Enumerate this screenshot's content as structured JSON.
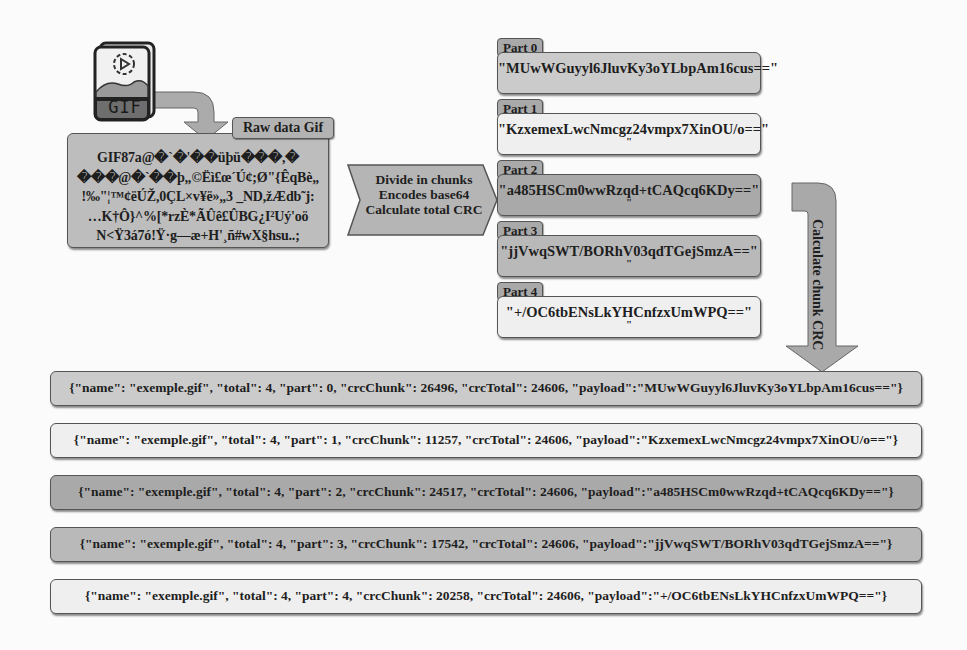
{
  "colors": {
    "light_box": "#efefef",
    "mid_box": "#c6c6c6",
    "dark_box": "#a8a8a8",
    "arrow_fill": "#ababab",
    "border": "#555555"
  },
  "gif_icon": {
    "label": "GIF",
    "icon": "gif-file-icon"
  },
  "raw_data": {
    "tag": "Raw data Gif",
    "lines": [
      "GIF87a@�`�'��üþü���,�",
      "���@�`��þ„©Ëì£œ´Ú¢;Ø\"{ÊqBè„",
      "!‰\"¦™¢ëÚŽ,0ÇL×v¥ë»„3  _ND,žÆdb˜j:",
      "…K†Ô}^%[*rzÈ*ÃÛê£ÛBG¿I²Uý'oö",
      "N<Ÿ3á7ó!Ÿ·g—æ+H'¸ñ#wX§hsu..;"
    ]
  },
  "process_arrow": {
    "lines": [
      "Divide in chunks",
      "Encodes base64",
      "Calculate total CRC"
    ]
  },
  "parts": [
    {
      "tag": "Part 0",
      "value": "\"MUwWGuyyl6JluvKy3oYLbpAm16cus==\"",
      "trail": ""
    },
    {
      "tag": "Part 1",
      "value": "\"KzxemexLwcNmcgz24vmpx7XinOU/o==\"",
      "trail": "\""
    },
    {
      "tag": "Part 2",
      "value": "\"a485HSCm0wwRzqd+tCAQcq6KDy==\"",
      "trail": "\""
    },
    {
      "tag": "Part 3",
      "value": "\"jjVwqSWT/BORhV03qdTGejSmzA==\"",
      "trail": "\""
    },
    {
      "tag": "Part 4",
      "value": "\"+/OC6tbENsLkYHCnfzxUmWPQ==\"",
      "trail": "\""
    }
  ],
  "crc_arrow": {
    "label": "Calculate chunk CRC"
  },
  "json_rows": [
    "{\"name\": \"exemple.gif\", \"total\": 4, \"part\": 0, \"crcChunk\": 26496, \"crcTotal\": 24606, \"payload\":\"MUwWGuyyl6JluvKy3oYLbpAm16cus==\"}",
    "{\"name\": \"exemple.gif\", \"total\": 4, \"part\": 1, \"crcChunk\": 11257, \"crcTotal\": 24606, \"payload\":\"KzxemexLwcNmcgz24vmpx7XinOU/o==\"}",
    "{\"name\": \"exemple.gif\", \"total\": 4, \"part\": 2, \"crcChunk\": 24517, \"crcTotal\": 24606, \"payload\":\"a485HSCm0wwRzqd+tCAQcq6KDy==\"}",
    "{\"name\": \"exemple.gif\", \"total\": 4, \"part\": 3, \"crcChunk\": 17542, \"crcTotal\": 24606, \"payload\":\"jjVwqSWT/BORhV03qdTGejSmzA==\"}",
    "{\"name\": \"exemple.gif\", \"total\": 4, \"part\": 4, \"crcChunk\": 20258, \"crcTotal\": 24606, \"payload\":\"+/OC6tbENsLkYHCnfzxUmWPQ==\"}"
  ]
}
